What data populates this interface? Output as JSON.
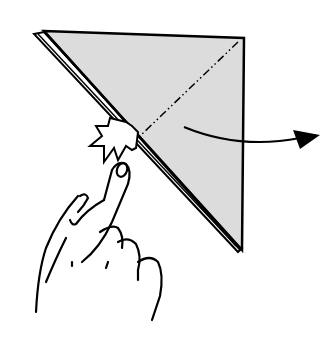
{
  "diagram": {
    "type": "origami-step",
    "elements": {
      "paper": {
        "shape": "triangle",
        "fill": "#d9d9d9",
        "stroke": "#000000"
      },
      "fold_line": {
        "style": "dash-dot",
        "description": "valley/mountain fold line"
      },
      "arrow": {
        "direction": "right",
        "description": "fold flap to the right"
      },
      "push_symbol": {
        "description": "push / reverse-fold indicator"
      },
      "hand": {
        "description": "finger pressing at fold point"
      }
    }
  }
}
